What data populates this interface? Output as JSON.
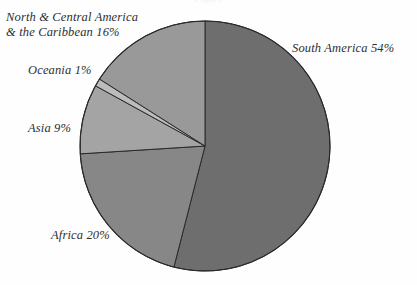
{
  "figure": {
    "title_remnant": "Figure",
    "background_color": "#fefefe"
  },
  "labels": {
    "north_central_america_line1": "North & Central America",
    "north_central_america_line2": "& the Caribbean 16%",
    "south_america": "South America 54%",
    "oceania": "Oceania 1%",
    "asia": "Asia 9%",
    "africa": "Africa 20%"
  },
  "chart_data": {
    "type": "pie",
    "title": "",
    "categories": [
      "South America",
      "Africa",
      "Asia",
      "Oceania",
      "North & Central America & the Caribbean"
    ],
    "values": [
      54,
      20,
      9,
      1,
      16
    ],
    "value_unit": "%",
    "value_labels": [
      "54%",
      "20%",
      "9%",
      "1%",
      "16%"
    ],
    "colors": [
      "#6e6e6e",
      "#878787",
      "#a4a4a4",
      "#bcbcbc",
      "#999999"
    ],
    "slice_outline_color": "#2a2a2a",
    "start_angle_deg": 0,
    "direction": "clockwise",
    "legend": "none",
    "annotations": [
      "North & Central America & the Caribbean 16%",
      "South America 54%",
      "Oceania 1%",
      "Asia 9%",
      "Africa 20%"
    ],
    "center_px": [
      205,
      146
    ],
    "radius_px": 125,
    "grid": false,
    "xlabel": "",
    "ylabel": ""
  }
}
